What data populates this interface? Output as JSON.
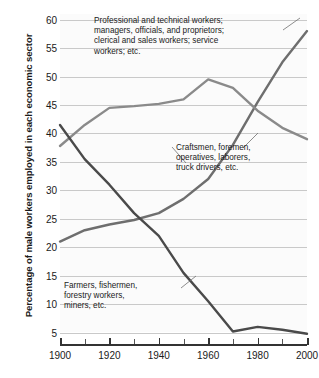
{
  "chart_data": {
    "type": "line",
    "title": "",
    "xlabel": "",
    "ylabel": "Percentage of male workers employed in each economic sector",
    "xlim": [
      1900,
      2000
    ],
    "ylim": [
      3,
      61
    ],
    "grid": true,
    "legend": "annotations-inline",
    "xticks": [
      1900,
      1920,
      1940,
      1960,
      1980,
      2000
    ],
    "xticks_minor": [
      1910,
      1930,
      1950,
      1970,
      1990
    ],
    "yticks": [
      5,
      10,
      15,
      20,
      25,
      30,
      35,
      40,
      45,
      50,
      55,
      60
    ],
    "x": [
      1900,
      1910,
      1920,
      1930,
      1940,
      1950,
      1960,
      1970,
      1980,
      1990,
      2000
    ],
    "series": [
      {
        "name": "Professional and technical workers; managers, officials, and proprietors; clerical and sales workers; service workers; etc.",
        "short_name": "professional",
        "color": "#6e6e6e",
        "values": [
          21.0,
          23.0,
          24.0,
          24.8,
          26.0,
          28.5,
          32.0,
          38.0,
          45.5,
          52.5,
          58.0
        ]
      },
      {
        "name": "Craftsmen, foremen, operatives, laborers, truck drivers, etc.",
        "short_name": "craftsmen",
        "color": "#8a8a8a",
        "values": [
          37.8,
          41.5,
          44.5,
          44.8,
          45.2,
          46.0,
          49.5,
          48.0,
          44.0,
          41.0,
          39.0
        ]
      },
      {
        "name": "Farmers, fishermen, forestry workers, miners, etc.",
        "short_name": "farmers",
        "color": "#4a4a4a",
        "values": [
          41.5,
          35.5,
          31.0,
          26.0,
          22.0,
          15.5,
          10.5,
          5.2,
          6.0,
          5.5,
          4.8
        ]
      }
    ],
    "annotations": [
      {
        "id": "professional",
        "text": "Professional and technical workers;\nmanagers, officials, and proprietors;\nclerical and sales workers; service\nworkers; etc."
      },
      {
        "id": "craftsmen",
        "text": "Craftsmen, foremen,\noperatives, laborers,\ntruck drivers, etc."
      },
      {
        "id": "farmers",
        "text": "Farmers, fishermen,\nforestry workers,\nminers, etc."
      }
    ]
  },
  "axis": {
    "y_title": "Percentage of male workers employed in each economic sector"
  }
}
